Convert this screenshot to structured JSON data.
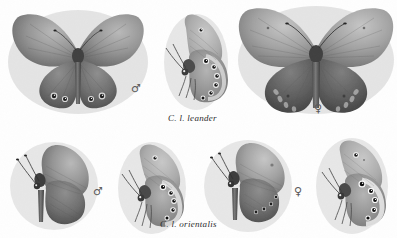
{
  "plate": {
    "background_color": "#fefefe",
    "ink_color": "#3a3a3a",
    "caption_color": "#2b2b2b",
    "medium": "grayscale halftone photographic plate"
  },
  "captions": [
    {
      "id": "caption-leander",
      "text": "C. l. leander",
      "x": 168,
      "y": 113
    },
    {
      "id": "caption-orientalis",
      "text": "C. l. orientalis",
      "x": 160,
      "y": 219
    }
  ],
  "sex_marks": [
    {
      "id": "sex-top-male",
      "symbol": "♂",
      "label": "male",
      "x": 131,
      "y": 83
    },
    {
      "id": "sex-top-female",
      "symbol": "♀",
      "label": "female",
      "x": 314,
      "y": 103
    },
    {
      "id": "sex-bottom-male",
      "symbol": "♂",
      "label": "male",
      "x": 93,
      "y": 186
    },
    {
      "id": "sex-bottom-female",
      "symbol": "♀",
      "label": "female",
      "x": 294,
      "y": 186
    }
  ],
  "specimens": [
    {
      "id": "leander-male-dorsal",
      "view": "dorsal",
      "sex": "male",
      "taxon": "C. l. leander",
      "x": 8,
      "y": 6,
      "width": 140,
      "height": 108,
      "forewing_tone": "#8e8e8e",
      "hindwing_tone": "#6e6e6e",
      "ocelli_count": 5
    },
    {
      "id": "leander-male-ventral",
      "view": "ventral-lateral",
      "sex": "male",
      "taxon": "C. l. leander",
      "x": 160,
      "y": 10,
      "width": 72,
      "height": 100,
      "forewing_tone": "#a8a8a8",
      "hindwing_tone": "#8f8f8f",
      "ocelli_count": 6
    },
    {
      "id": "leander-female-dorsal",
      "view": "dorsal",
      "sex": "female",
      "taxon": "C. l. leander",
      "x": 238,
      "y": 4,
      "width": 156,
      "height": 112,
      "forewing_tone": "#989898",
      "hindwing_tone": "#5f5f5f",
      "ocelli_count": 6
    },
    {
      "id": "orientalis-male-dorsal",
      "view": "dorsal",
      "sex": "male",
      "taxon": "C. l. orientalis",
      "x": 8,
      "y": 132,
      "width": 92,
      "height": 96,
      "forewing_tone": "#7e7e7e",
      "hindwing_tone": "#6a6a6a",
      "ocelli_count": 0
    },
    {
      "id": "orientalis-male-ventral",
      "view": "ventral-lateral",
      "sex": "male",
      "taxon": "C. l. orientalis",
      "x": 112,
      "y": 138,
      "width": 80,
      "height": 96,
      "forewing_tone": "#a5a5a5",
      "hindwing_tone": "#7d7d7d",
      "ocelli_count": 5
    },
    {
      "id": "orientalis-female-dorsal",
      "view": "dorsal",
      "sex": "female",
      "taxon": "C. l. orientalis",
      "x": 204,
      "y": 134,
      "width": 90,
      "height": 98,
      "forewing_tone": "#8c8c8c",
      "hindwing_tone": "#6f6f6f",
      "ocelli_count": 4
    },
    {
      "id": "orientalis-female-ventral",
      "view": "ventral-lateral",
      "sex": "female",
      "taxon": "C. l. orientalis",
      "x": 310,
      "y": 134,
      "width": 86,
      "height": 100,
      "forewing_tone": "#a0a0a0",
      "hindwing_tone": "#8a8a8a",
      "ocelli_count": 5
    }
  ]
}
